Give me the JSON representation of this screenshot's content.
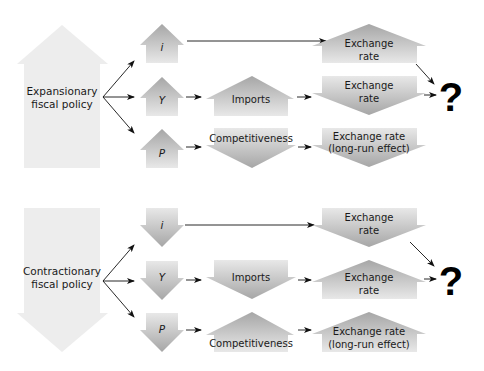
{
  "figure": {
    "panels": [
      {
        "id": "expansionary",
        "policy": {
          "line1": "Expansionary",
          "line2": "fiscal policy",
          "direction": "up"
        },
        "rows": [
          {
            "variable": "i",
            "var_dir": "up",
            "middle": null,
            "result": {
              "line1": "Exchange",
              "line2": "rate",
              "dir": "up"
            }
          },
          {
            "variable": "Y",
            "var_dir": "up",
            "middle": {
              "label": "Imports",
              "dir": "up"
            },
            "result": {
              "line1": "Exchange",
              "line2": "rate",
              "dir": "down"
            }
          },
          {
            "variable": "P",
            "var_dir": "up",
            "middle": {
              "label": "Competitiveness",
              "dir": "down"
            },
            "result": {
              "line1": "Exchange rate",
              "line2": "(long-run effect)",
              "dir": "down"
            }
          }
        ],
        "outcome": "?"
      },
      {
        "id": "contractionary",
        "policy": {
          "line1": "Contractionary",
          "line2": "fiscal policy",
          "direction": "down"
        },
        "rows": [
          {
            "variable": "i",
            "var_dir": "down",
            "middle": null,
            "result": {
              "line1": "Exchange",
              "line2": "rate",
              "dir": "down"
            }
          },
          {
            "variable": "Y",
            "var_dir": "down",
            "middle": {
              "label": "Imports",
              "dir": "down"
            },
            "result": {
              "line1": "Exchange",
              "line2": "rate",
              "dir": "up"
            }
          },
          {
            "variable": "P",
            "var_dir": "down",
            "middle": {
              "label": "Competitiveness",
              "dir": "up"
            },
            "result": {
              "line1": "Exchange rate",
              "line2": "(long-run effect)",
              "dir": "up"
            }
          }
        ],
        "outcome": "?"
      }
    ],
    "colors": {
      "big_arrow": "#ececec",
      "arrow_light": "#e6e6e6",
      "arrow_dark": "#a9a9a9",
      "text": "#1a1a1a"
    }
  }
}
